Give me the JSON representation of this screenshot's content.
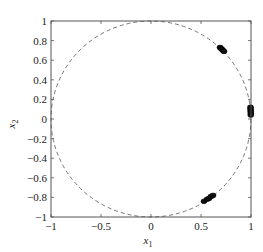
{
  "chart_data": {
    "type": "scatter",
    "title": "",
    "xlabel": "x1",
    "ylabel": "x2",
    "xlabel_main": "x",
    "xlabel_sub": "1",
    "ylabel_main": "x",
    "ylabel_sub": "2",
    "xlim": [
      -1,
      1
    ],
    "ylim": [
      -1,
      1
    ],
    "grid": false,
    "legend": null,
    "x_ticks": [
      -1,
      -0.5,
      0,
      0.5,
      1
    ],
    "x_tick_labels": [
      "−1",
      "−0.5",
      "0",
      "0.5",
      "1"
    ],
    "y_ticks": [
      1,
      0.8,
      0.6,
      0.4,
      0.2,
      0,
      -0.2,
      -0.4,
      -0.6,
      -0.8,
      -1
    ],
    "y_tick_labels": [
      "1",
      "0.8",
      "0.6",
      "0.4",
      "0.2",
      "0",
      "−0.2",
      "−0.4",
      "−0.6",
      "−0.8",
      "−1"
    ],
    "reference_curve": {
      "name": "unit circle",
      "style": "dashed",
      "center": [
        0,
        0
      ],
      "radius": 1
    },
    "series": [
      {
        "name": "cluster 1",
        "points": [
          [
            0.69,
            0.73
          ],
          [
            0.7,
            0.72
          ],
          [
            0.71,
            0.71
          ],
          [
            0.72,
            0.7
          ],
          [
            0.73,
            0.69
          ]
        ]
      },
      {
        "name": "cluster 2",
        "points": [
          [
            0.995,
            0.12
          ],
          [
            0.996,
            0.1
          ],
          [
            0.997,
            0.08
          ],
          [
            0.998,
            0.06
          ],
          [
            0.998,
            0.04
          ]
        ]
      },
      {
        "name": "cluster 3",
        "points": [
          [
            0.53,
            -0.84
          ],
          [
            0.56,
            -0.82
          ],
          [
            0.58,
            -0.81
          ],
          [
            0.6,
            -0.79
          ],
          [
            0.62,
            -0.78
          ]
        ]
      }
    ]
  }
}
